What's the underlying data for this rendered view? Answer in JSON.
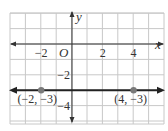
{
  "chart_data": {
    "type": "line",
    "title": "",
    "xlabel": "x",
    "ylabel": "y",
    "origin_label": "O",
    "xlim": [
      -4,
      6
    ],
    "ylim": [
      -5,
      2
    ],
    "grid": true,
    "x_ticks": [
      {
        "value": -2,
        "label": "−2"
      },
      {
        "value": 2,
        "label": "2"
      },
      {
        "value": 4,
        "label": "4"
      }
    ],
    "y_ticks": [
      {
        "value": -2,
        "label": "−2"
      },
      {
        "value": -4,
        "label": "−4"
      }
    ],
    "series": [
      {
        "name": "horizontal line y = -3",
        "equation": "y = -3",
        "points": [
          {
            "x": -2,
            "y": -3,
            "label": "(−2, −3)"
          },
          {
            "x": 4,
            "y": -3,
            "label": "(4, −3)"
          }
        ],
        "arrows_both_ends": true
      }
    ]
  },
  "colors": {
    "grid": "#c8c8c8",
    "axis": "#333333",
    "line": "#222222",
    "point": "#7a7a7a",
    "text": "#333333"
  }
}
